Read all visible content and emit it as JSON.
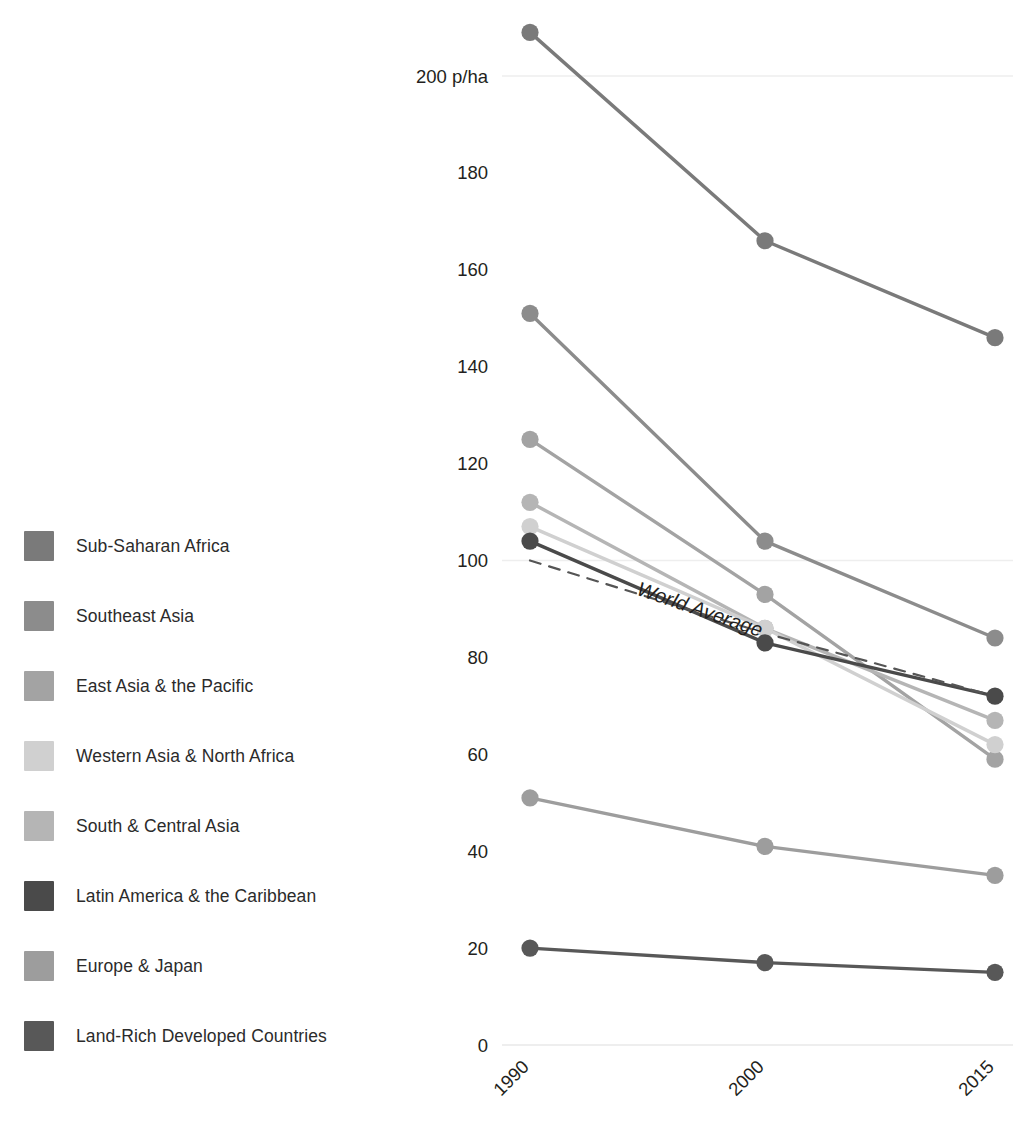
{
  "legend": {
    "items": [
      {
        "label": "Sub-Saharan Africa",
        "color": "#7a7a7a"
      },
      {
        "label": "Southeast Asia",
        "color": "#8c8c8c"
      },
      {
        "label": "East Asia & the Pacific",
        "color": "#a3a3a3"
      },
      {
        "label": "Western Asia & North Africa",
        "color": "#d0d0d0"
      },
      {
        "label": "South & Central Asia",
        "color": "#b5b5b5"
      },
      {
        "label": "Latin America & the Caribbean",
        "color": "#4a4a4a"
      },
      {
        "label": "Europe & Japan",
        "color": "#9d9d9d"
      },
      {
        "label": "Land-Rich Developed Countries",
        "color": "#585858"
      }
    ]
  },
  "chart_data": {
    "type": "line",
    "title": "",
    "xlabel": "",
    "ylabel": "",
    "unit_label": "p/ha",
    "categories": [
      "1990",
      "2000",
      "2015"
    ],
    "x_tick_labels": [
      "1990",
      "2000",
      "2015"
    ],
    "x_tick_rotation_deg": -45,
    "y_tick_labels": [
      "200 p/ha",
      "180",
      "160",
      "140",
      "120",
      "100",
      "80",
      "60",
      "40",
      "20",
      "0"
    ],
    "y_ticks": [
      200,
      180,
      160,
      140,
      120,
      100,
      80,
      60,
      40,
      20,
      0
    ],
    "ylim": [
      0,
      215
    ],
    "grid": "horizontal-sparse",
    "gridlines_at": [
      200,
      100
    ],
    "legend_position": "left",
    "markers": true,
    "series": [
      {
        "name": "Sub-Saharan Africa",
        "color": "#7a7a7a",
        "values": [
          209,
          166,
          146
        ],
        "style": "solid"
      },
      {
        "name": "Southeast Asia",
        "color": "#8c8c8c",
        "values": [
          151,
          104,
          84
        ],
        "style": "solid"
      },
      {
        "name": "East Asia & the Pacific",
        "color": "#a3a3a3",
        "values": [
          125,
          93,
          59
        ],
        "style": "solid"
      },
      {
        "name": "South & Central Asia",
        "color": "#b5b5b5",
        "values": [
          112,
          86,
          67
        ],
        "style": "solid"
      },
      {
        "name": "Western Asia & North Africa",
        "color": "#d0d0d0",
        "values": [
          107,
          86,
          62
        ],
        "style": "solid"
      },
      {
        "name": "Latin America & the Caribbean",
        "color": "#4a4a4a",
        "values": [
          104,
          83,
          72
        ],
        "style": "solid"
      },
      {
        "name": "Europe & Japan",
        "color": "#9d9d9d",
        "values": [
          51,
          41,
          35
        ],
        "style": "solid"
      },
      {
        "name": "Land-Rich Developed Countries",
        "color": "#585858",
        "values": [
          20,
          17,
          15
        ],
        "style": "solid"
      },
      {
        "name": "World Average",
        "color": "#555555",
        "values": [
          100,
          85,
          72
        ],
        "style": "dashed",
        "annotation": "World Average"
      }
    ],
    "annotations": [
      {
        "text": "World Average",
        "x_value": 1994.5,
        "y_value": 93,
        "rotation_deg": 19,
        "italic": true
      }
    ]
  },
  "axis": {
    "unit_suffix": " p/ha"
  }
}
